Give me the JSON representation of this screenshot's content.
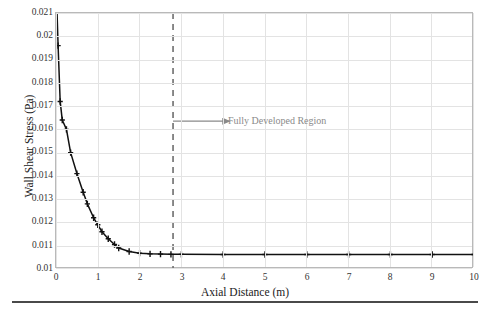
{
  "chart_data": {
    "type": "line",
    "title": "",
    "xlabel": "Axial Distance (m)",
    "ylabel": "Wall Shear Stress (Pa)",
    "xlim": [
      0,
      10
    ],
    "ylim": [
      0.01,
      0.021
    ],
    "xticks": [
      "0",
      "1",
      "2",
      "3",
      "4",
      "5",
      "6",
      "7",
      "8",
      "9",
      "10"
    ],
    "yticks": [
      "0.01",
      "0.011",
      "0.012",
      "0.013",
      "0.014",
      "0.015",
      "0.016",
      "0.017",
      "0.018",
      "0.019",
      "0.02",
      "0.021"
    ],
    "grid": true,
    "legend": "none",
    "series": [
      {
        "name": "Wall Shear Stress",
        "marker": "plus",
        "color": "#111111",
        "x": [
          0.02,
          0.05,
          0.1,
          0.15,
          0.25,
          0.35,
          0.5,
          0.65,
          0.75,
          0.9,
          1.0,
          1.1,
          1.25,
          1.4,
          1.5,
          1.75,
          2.0,
          2.25,
          2.5,
          2.75,
          3.0,
          4.0,
          5.0,
          6.0,
          7.0,
          8.0,
          9.0,
          10.0
        ],
        "y": [
          0.0213,
          0.0196,
          0.0172,
          0.0164,
          0.016,
          0.015,
          0.0141,
          0.0133,
          0.0128,
          0.0122,
          0.0119,
          0.0116,
          0.0113,
          0.01105,
          0.0109,
          0.01075,
          0.01068,
          0.01065,
          0.01064,
          0.01063,
          0.01063,
          0.01062,
          0.01062,
          0.01062,
          0.01062,
          0.01062,
          0.01062,
          0.01062
        ]
      }
    ],
    "vline": {
      "x": 2.8,
      "style": "dashed",
      "color": "#6e6e6e"
    },
    "annotation": {
      "text": "Fully Developed Region",
      "arrow_from_x": 2.8,
      "arrow_to_x": 4.15,
      "y": 0.01635,
      "color": "#8a8a8a"
    }
  },
  "axes": {
    "x_title": "Axial Distance (m)",
    "y_title": "Wall Shear Stress (Pa)"
  }
}
